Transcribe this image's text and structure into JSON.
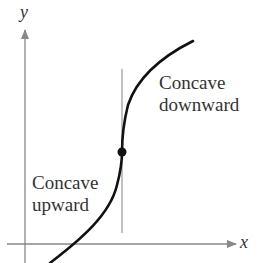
{
  "diagram": {
    "axes": {
      "x_label": "x",
      "y_label": "y"
    },
    "regions": {
      "downward": {
        "line1": "Concave",
        "line2": "downward"
      },
      "upward": {
        "line1": "Concave",
        "line2": "upward"
      }
    },
    "inflection_point": "point of inflection (marked dot)",
    "colors": {
      "axis": "#888888",
      "curve": "#111111",
      "tangent": "#999999"
    }
  }
}
